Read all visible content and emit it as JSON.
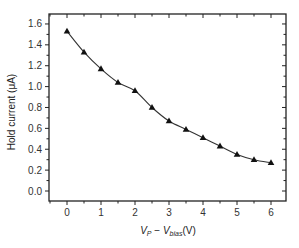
{
  "chart_data": {
    "type": "line",
    "title": "",
    "xlabel": "V_P − V_bias(V)",
    "xlabel_parts": {
      "v1": "V",
      "sub1": "P",
      "minus": " − ",
      "v2": "V",
      "sub2": "bias",
      "unit": "(V)"
    },
    "ylabel": "Hold current (μA)",
    "xlim": [
      -0.5,
      6.5
    ],
    "ylim": [
      -0.1,
      1.7
    ],
    "xticks": [
      0,
      1,
      2,
      3,
      4,
      5,
      6
    ],
    "xtick_labels": [
      "0",
      "1",
      "2",
      "3",
      "4",
      "5",
      "6"
    ],
    "yticks": [
      0.0,
      0.2,
      0.4,
      0.6,
      0.8,
      1.0,
      1.2,
      1.4,
      1.6
    ],
    "ytick_labels": [
      "0.0",
      "0.2",
      "0.4",
      "0.6",
      "0.8",
      "1.0",
      "1.2",
      "1.4",
      "1.6"
    ],
    "grid": false,
    "legend": null,
    "marker": "triangle-up",
    "line_color": "#333333",
    "marker_color": "#111111",
    "series": [
      {
        "name": "Hold current",
        "x": [
          0,
          0.5,
          1,
          1.5,
          2,
          2.5,
          3,
          3.5,
          4,
          4.5,
          5,
          5.5,
          6
        ],
        "values": [
          1.53,
          1.33,
          1.17,
          1.04,
          0.96,
          0.8,
          0.67,
          0.59,
          0.51,
          0.43,
          0.35,
          0.3,
          0.27
        ]
      }
    ]
  }
}
